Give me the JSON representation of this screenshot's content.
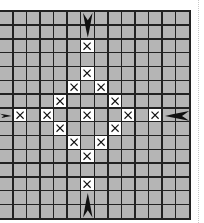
{
  "diagram": {
    "title": "",
    "grid": {
      "rows": 15,
      "cols": 14,
      "cell_fill": "#b5b5b5",
      "line_color": "#222222",
      "mark_fill": "#ffffff"
    },
    "marks": [
      {
        "type": "x",
        "row": 2,
        "col": 6
      },
      {
        "type": "x",
        "row": 4,
        "col": 6
      },
      {
        "type": "x",
        "row": 5,
        "col": 5
      },
      {
        "type": "x",
        "row": 5,
        "col": 7
      },
      {
        "type": "x",
        "row": 6,
        "col": 4
      },
      {
        "type": "x",
        "row": 6,
        "col": 8
      },
      {
        "type": "x",
        "row": 7,
        "col": 1
      },
      {
        "type": "x",
        "row": 7,
        "col": 3
      },
      {
        "type": "x",
        "row": 7,
        "col": 6
      },
      {
        "type": "x",
        "row": 7,
        "col": 9
      },
      {
        "type": "x",
        "row": 7,
        "col": 11
      },
      {
        "type": "x",
        "row": 8,
        "col": 4
      },
      {
        "type": "x",
        "row": 8,
        "col": 8
      },
      {
        "type": "x",
        "row": 9,
        "col": 5
      },
      {
        "type": "x",
        "row": 9,
        "col": 7
      },
      {
        "type": "x",
        "row": 10,
        "col": 6
      },
      {
        "type": "x",
        "row": 12,
        "col": 6
      }
    ],
    "arrows": [
      {
        "name": "top-center-arrow",
        "direction": "down",
        "row": 0,
        "col": 6,
        "span_rows": 2
      },
      {
        "name": "bottom-center-arrow",
        "direction": "up",
        "row": 13,
        "col": 6,
        "span_rows": 2
      },
      {
        "name": "left-center-arrow",
        "direction": "right",
        "row": 7,
        "col": 0,
        "span_cols": 1
      },
      {
        "name": "right-center-arrow",
        "direction": "left",
        "row": 7,
        "col": 12,
        "span_cols": 2
      }
    ],
    "arrow_color": "#111111"
  }
}
